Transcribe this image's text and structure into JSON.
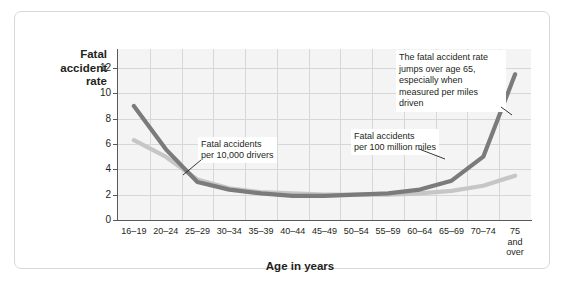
{
  "chart_data": {
    "type": "line",
    "title": "",
    "ylabel": "Fatal accident rate",
    "xlabel": "Age in years",
    "ylim": [
      0,
      13.5
    ],
    "yticks": [
      0,
      2,
      4,
      6,
      8,
      10,
      12
    ],
    "grid": true,
    "legend_position": "inline-callouts",
    "categories": [
      "16–19",
      "20–24",
      "25–29",
      "30–34",
      "35–39",
      "40–44",
      "45–49",
      "50–54",
      "55–59",
      "60–64",
      "65–69",
      "70–74",
      "75\nand\nover"
    ],
    "series": [
      {
        "name": "Fatal accidents per 100 million miles",
        "color": "#7b7b7b",
        "values": [
          9.0,
          5.6,
          3.0,
          2.4,
          2.1,
          1.9,
          1.9,
          2.0,
          2.1,
          2.4,
          3.1,
          5.0,
          11.5
        ]
      },
      {
        "name": "Fatal accidents per 10,000 drivers",
        "color": "#c6c6c6",
        "values": [
          6.3,
          5.0,
          3.2,
          2.5,
          2.2,
          2.1,
          2.0,
          2.0,
          2.0,
          2.1,
          2.3,
          2.7,
          3.5
        ]
      }
    ],
    "annotations": [
      {
        "name": "note",
        "text": "The fatal accident rate jumps over age 65, especially when measured per miles driven"
      },
      {
        "name": "drivers-label",
        "text": "Fatal accidents\nper 10,000 drivers"
      },
      {
        "name": "miles-label",
        "text": "Fatal accidents\nper 100 million miles"
      }
    ]
  },
  "axis": {
    "y_title": "Fatal\naccident\nrate",
    "x_title": "Age in years"
  }
}
